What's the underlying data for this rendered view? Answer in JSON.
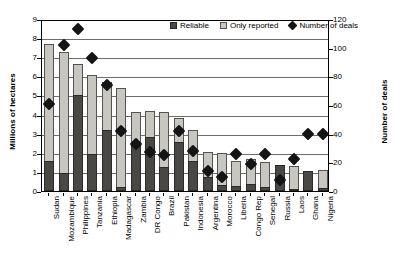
{
  "chart_data": {
    "type": "bar",
    "title": "",
    "xlabel": "",
    "ylabel": "Millions of hectares",
    "y2label": "Number of deals",
    "ylim": [
      0,
      9
    ],
    "y2lim": [
      0,
      120
    ],
    "yticks": [
      0,
      1,
      2,
      3,
      4,
      5,
      6,
      7,
      8,
      9
    ],
    "y2ticks": [
      0,
      20,
      40,
      60,
      80,
      100,
      120
    ],
    "grid": true,
    "legend_position": "top-center",
    "categories": [
      "Sudan",
      "Mozambique",
      "Philippines",
      "Tanzania",
      "Ethiopia",
      "Madagascar",
      "Zambia",
      "DR Congo",
      "Brazil",
      "Pakistan",
      "Indonesia",
      "Argentina",
      "Morocco",
      "Liberia",
      "Congo Rep",
      "Senegal",
      "Russia",
      "Laos",
      "Ghana",
      "Nigeria"
    ],
    "series": [
      {
        "name": "Reliable",
        "axis": "left",
        "color": "#4a4845",
        "values": [
          1.55,
          0.95,
          5.05,
          1.95,
          3.2,
          0.2,
          2.4,
          2.85,
          1.25,
          2.55,
          1.55,
          0.75,
          0.3,
          0.25,
          0.35,
          0.2,
          1.35,
          0.1,
          1.05,
          0.15
        ]
      },
      {
        "name": "Only reported",
        "axis": "left",
        "color": "#c8c6c0",
        "values": [
          6.15,
          6.3,
          1.6,
          4.1,
          2.5,
          5.2,
          1.75,
          1.35,
          2.9,
          1.25,
          1.65,
          1.3,
          1.7,
          1.3,
          1.3,
          1.3,
          0.0,
          1.2,
          0.0,
          0.95
        ]
      },
      {
        "name": "Number of deals",
        "axis": "right",
        "color": "#141414",
        "values": [
          61,
          102,
          113,
          93,
          74,
          42,
          33,
          27,
          25,
          42,
          28,
          14,
          10,
          26,
          19,
          26,
          8,
          22,
          40,
          40
        ]
      }
    ],
    "totals": [
      7.7,
      7.25,
      6.65,
      6.05,
      5.7,
      5.4,
      4.15,
      4.2,
      4.15,
      3.8,
      3.2,
      2.05,
      2.0,
      1.55,
      1.65,
      1.5,
      1.35,
      1.3,
      1.05,
      1.1
    ]
  },
  "legend": {
    "items": [
      {
        "label": "Reliable",
        "icon": "square-dark-icon"
      },
      {
        "label": "Only reported",
        "icon": "square-light-icon"
      },
      {
        "label": "Number of deals",
        "icon": "diamond-icon"
      }
    ]
  }
}
